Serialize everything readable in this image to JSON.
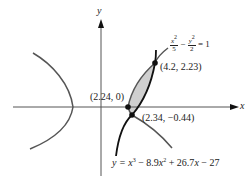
{
  "diagram": {
    "axes": {
      "x_label": "x",
      "y_label": "y"
    },
    "curves": {
      "hyperbola": {
        "label": "x²/5 − y²/2 = 1",
        "lhs_term1_num": "x",
        "lhs_term1_exp": "2",
        "lhs_term1_den": "5",
        "minus": "−",
        "lhs_term2_num": "y",
        "lhs_term2_exp": "2",
        "lhs_term2_den": "2",
        "equals": "= 1",
        "color": "#555555"
      },
      "cubic": {
        "label": "y = x³ − 8.9x² + 26.7x − 27",
        "prefix": "y = ",
        "t1_var": "x",
        "t1_exp": "3",
        "t2_text": " − 8.9",
        "t2_var": "x",
        "t2_exp": "2",
        "t3_text": " + 26.7",
        "t3_var": "x",
        "t4_text": " − 27",
        "color": "#111111"
      }
    },
    "shaded_region": {
      "fill": "#cfcfcf"
    },
    "intersection_points": [
      {
        "label": "(2.24, 0)",
        "x": 2.24,
        "y": 0
      },
      {
        "label": "(2.34, −0.44)",
        "x": 2.34,
        "y": -0.44
      },
      {
        "label": "(4.2, 2.23)",
        "x": 4.2,
        "y": 2.23
      }
    ]
  }
}
